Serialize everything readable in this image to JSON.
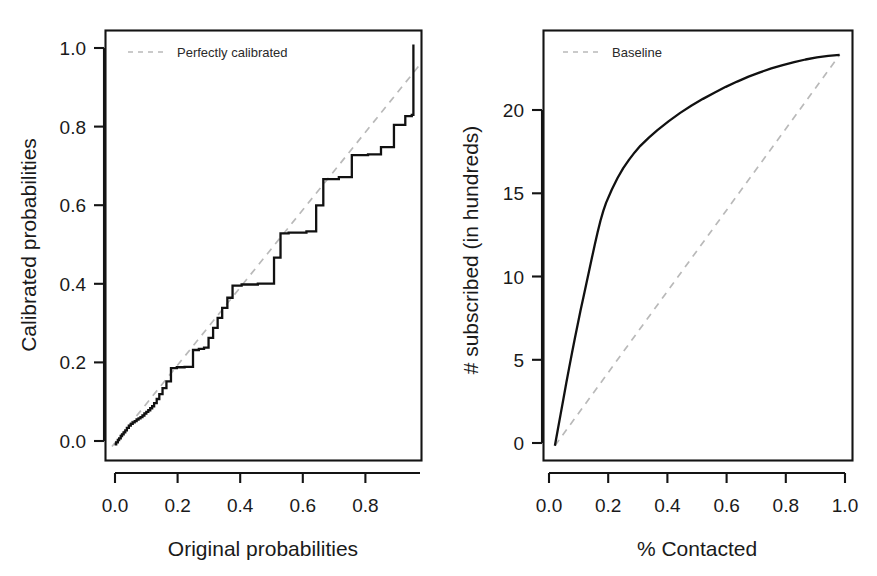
{
  "figure": {
    "background_color": "#ffffff",
    "curve_color": "#111111",
    "reference_color": "#b9b9b9",
    "frame_color": "#141414",
    "panel_count": 2
  },
  "chart_data": [
    {
      "type": "line",
      "panel": "left",
      "title": "",
      "xlabel": "Original probabilities",
      "ylabel": "Calibrated probabilities",
      "xlim": [
        -0.02,
        0.955
      ],
      "ylim": [
        -0.035,
        1.035
      ],
      "xticks": [
        0.0,
        0.2,
        0.4,
        0.6,
        0.8
      ],
      "xticklabels": [
        "0.0",
        "0.2",
        "0.4",
        "0.6",
        "0.8"
      ],
      "yticks": [
        0.0,
        0.2,
        0.4,
        0.6,
        0.8,
        1.0
      ],
      "yticklabels": [
        "0.0",
        "0.2",
        "0.4",
        "0.6",
        "0.8",
        "1.0"
      ],
      "grid": false,
      "legend_position": "top-left",
      "legend": [
        {
          "label": "Perfectly calibrated",
          "style": "dashed",
          "color": "#b9b9b9"
        }
      ],
      "series": [
        {
          "name": "Calibration step function",
          "style": "step",
          "color": "#111111",
          "x": [
            0.008,
            0.013,
            0.018,
            0.022,
            0.027,
            0.031,
            0.036,
            0.041,
            0.046,
            0.052,
            0.058,
            0.064,
            0.07,
            0.076,
            0.082,
            0.088,
            0.094,
            0.1,
            0.106,
            0.112,
            0.118,
            0.124,
            0.13,
            0.138,
            0.146,
            0.156,
            0.168,
            0.182,
            0.2,
            0.224,
            0.25,
            0.268,
            0.284,
            0.298,
            0.312,
            0.326,
            0.34,
            0.356,
            0.372,
            0.4,
            0.45,
            0.5,
            0.52,
            0.545,
            0.6,
            0.63,
            0.652,
            0.7,
            0.74,
            0.79,
            0.83,
            0.87,
            0.905,
            0.925,
            0.93
          ],
          "y": [
            0.005,
            0.01,
            0.016,
            0.02,
            0.026,
            0.03,
            0.035,
            0.04,
            0.046,
            0.052,
            0.056,
            0.06,
            0.063,
            0.067,
            0.07,
            0.073,
            0.077,
            0.082,
            0.086,
            0.09,
            0.095,
            0.1,
            0.108,
            0.118,
            0.13,
            0.145,
            0.162,
            0.195,
            0.197,
            0.198,
            0.24,
            0.243,
            0.246,
            0.27,
            0.295,
            0.32,
            0.345,
            0.37,
            0.4,
            0.403,
            0.405,
            0.47,
            0.53,
            0.532,
            0.535,
            0.6,
            0.665,
            0.67,
            0.725,
            0.727,
            0.745,
            0.8,
            0.822,
            0.825,
            1.0
          ]
        },
        {
          "name": "Perfectly calibrated",
          "style": "dashed",
          "color": "#b9b9b9",
          "x": [
            0.0,
            0.955
          ],
          "y": [
            0.0,
            0.955
          ]
        }
      ]
    },
    {
      "type": "line",
      "panel": "right",
      "title": "",
      "xlabel": "% Contacted",
      "ylabel": "# subscribed (in hundreds)",
      "xlim": [
        -0.04,
        1.045
      ],
      "ylim": [
        -0.9,
        25.2
      ],
      "xticks": [
        0.0,
        0.2,
        0.4,
        0.6,
        0.8,
        1.0
      ],
      "xticklabels": [
        "0.0",
        "0.2",
        "0.4",
        "0.6",
        "0.8",
        "1.0"
      ],
      "yticks": [
        0,
        5,
        10,
        15,
        20
      ],
      "yticklabels": [
        "0",
        "5",
        "10",
        "15",
        "20"
      ],
      "grid": false,
      "legend_position": "top-left",
      "legend": [
        {
          "label": "Baseline",
          "style": "dashed",
          "color": "#b9b9b9"
        }
      ],
      "series": [
        {
          "name": "Cumulative subscribed (lift)",
          "style": "solid",
          "color": "#111111",
          "x": [
            0.0,
            0.01,
            0.02,
            0.03,
            0.04,
            0.05,
            0.06,
            0.07,
            0.08,
            0.09,
            0.1,
            0.11,
            0.12,
            0.13,
            0.14,
            0.15,
            0.16,
            0.17,
            0.18,
            0.2,
            0.22,
            0.24,
            0.26,
            0.28,
            0.3,
            0.33,
            0.36,
            0.4,
            0.44,
            0.48,
            0.52,
            0.56,
            0.6,
            0.64,
            0.68,
            0.72,
            0.76,
            0.8,
            0.84,
            0.88,
            0.92,
            0.96,
            1.0
          ],
          "y": [
            0.0,
            0.95,
            1.9,
            2.85,
            3.8,
            4.72,
            5.62,
            6.5,
            7.35,
            8.2,
            9.0,
            9.8,
            10.6,
            11.4,
            12.2,
            12.95,
            13.65,
            14.25,
            14.75,
            15.55,
            16.25,
            16.85,
            17.35,
            17.8,
            18.2,
            18.7,
            19.15,
            19.7,
            20.2,
            20.65,
            21.05,
            21.42,
            21.78,
            22.1,
            22.4,
            22.66,
            22.9,
            23.1,
            23.28,
            23.44,
            23.57,
            23.66,
            23.72
          ]
        },
        {
          "name": "Baseline",
          "style": "dashed",
          "color": "#b9b9b9",
          "x": [
            0.0,
            1.0
          ],
          "y": [
            0.0,
            23.72
          ]
        }
      ]
    }
  ]
}
